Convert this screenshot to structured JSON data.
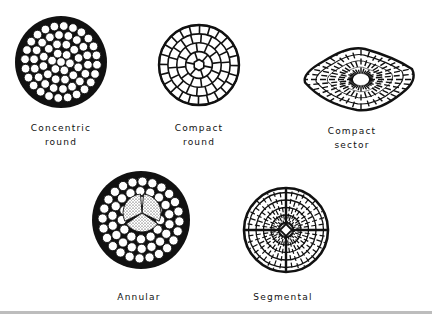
{
  "figure": {
    "background": "#ffffff",
    "ink_color": "#111111",
    "rule_color": "#bdbdbd",
    "conductors": [
      {
        "id": "concentric-round",
        "label_lines": [
          "Concentric",
          "round"
        ],
        "shape": "circle",
        "center": [
          61,
          62
        ],
        "radius": 46,
        "style": "round-strands",
        "strand_rings": [
          1,
          6,
          12,
          18,
          24
        ],
        "label_pos": [
          61,
          123
        ]
      },
      {
        "id": "compact-round",
        "label_lines": [
          "Compact",
          "round"
        ],
        "shape": "circle",
        "center": [
          199,
          65
        ],
        "radius": 40,
        "style": "compacted-cells",
        "cell_rings": [
          1,
          6,
          12,
          18,
          24
        ],
        "label_pos": [
          199,
          122
        ]
      },
      {
        "id": "compact-sector",
        "label_lines": [
          "Compact",
          "sector"
        ],
        "shape": "sector",
        "bounds": [
          302,
          47,
          416,
          110
        ],
        "style": "compacted-cells",
        "label_pos": [
          351,
          125
        ]
      },
      {
        "id": "annular",
        "label_lines": [
          "Annular"
        ],
        "shape": "circle",
        "center": [
          141,
          220
        ],
        "radius": 49,
        "style": "round-strands-with-core",
        "strand_rings": [
          12,
          18,
          24
        ],
        "core_radius": 19,
        "core_segments": 3,
        "label_pos": [
          138,
          291
        ]
      },
      {
        "id": "segmental",
        "label_lines": [
          "Segmental"
        ],
        "shape": "circle",
        "center": [
          286,
          230
        ],
        "radius": 42,
        "style": "four-segment-cells",
        "segments": 4,
        "label_pos": [
          283,
          291
        ]
      }
    ]
  }
}
